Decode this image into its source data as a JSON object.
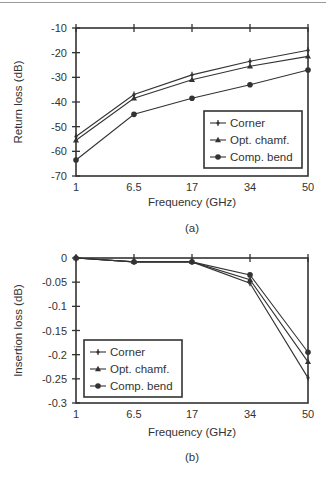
{
  "chart_data": [
    {
      "type": "line",
      "panel_label": "(a)",
      "title": "",
      "xlabel": "Frequency (GHz)",
      "ylabel": "Return loss (dB)",
      "categories": [
        "1",
        "6.5",
        "17",
        "34",
        "50"
      ],
      "yticks": [
        "-10",
        "-20",
        "-30",
        "-40",
        "-50",
        "-60",
        "-70"
      ],
      "ylim": [
        -70,
        -10
      ],
      "grid": false,
      "legend_position": "lower right",
      "series": [
        {
          "name": "Corner",
          "marker": "plus",
          "values": [
            -54,
            -37,
            -29,
            -23.5,
            -19
          ]
        },
        {
          "name": "Opt. chamf.",
          "marker": "triangle",
          "values": [
            -55.5,
            -38.5,
            -31,
            -25.5,
            -21.5
          ]
        },
        {
          "name": "Comp. bend",
          "marker": "circle",
          "values": [
            -63.5,
            -45,
            -38.5,
            -33,
            -27
          ]
        }
      ]
    },
    {
      "type": "line",
      "panel_label": "(b)",
      "title": "",
      "xlabel": "Frequency (GHz)",
      "ylabel": "Insertion loss (dB)",
      "categories": [
        "1",
        "6.5",
        "17",
        "34",
        "50"
      ],
      "yticks": [
        "0",
        "-0.05",
        "-0.1",
        "-0.15",
        "-0.2",
        "-0.25",
        "-0.3"
      ],
      "ylim": [
        -0.3,
        0
      ],
      "grid": false,
      "legend_position": "lower left",
      "series": [
        {
          "name": "Corner",
          "marker": "plus",
          "values": [
            0,
            -0.008,
            -0.008,
            -0.052,
            -0.248
          ]
        },
        {
          "name": "Opt. chamf.",
          "marker": "triangle",
          "values": [
            0,
            -0.008,
            -0.008,
            -0.045,
            -0.215
          ]
        },
        {
          "name": "Comp. bend",
          "marker": "circle",
          "values": [
            0,
            -0.008,
            -0.008,
            -0.035,
            -0.195
          ]
        }
      ]
    }
  ]
}
